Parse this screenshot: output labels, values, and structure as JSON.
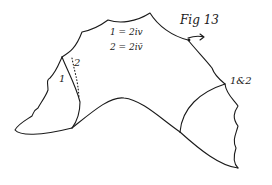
{
  "figure": {
    "title": "Fig 13",
    "equations": [
      {
        "lhs": "1",
        "rhs": "2iv"
      },
      {
        "lhs": "2",
        "rhs": "2iv̄"
      }
    ],
    "eq1": "1 = 2iv",
    "eq2": "2 = 2iv̄",
    "region_labels": {
      "region_1": "1",
      "region_2": "2",
      "region_1_and_2": "1&2"
    },
    "ink_color": "#1a1a1a",
    "background_color": "#ffffff"
  }
}
